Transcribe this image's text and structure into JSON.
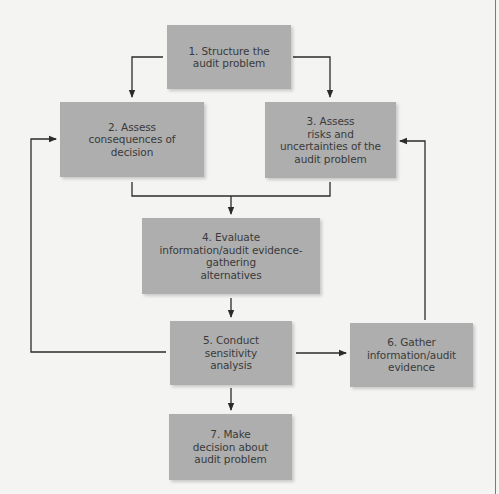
{
  "diagram": {
    "type": "flowchart",
    "colors": {
      "background": "#f4f4f3",
      "box_fill": "#aeaeae",
      "text": "#3a3a3a",
      "connector": "#2b2b2b"
    },
    "nodes": [
      {
        "id": 1,
        "label": "1. Structure the\naudit problem"
      },
      {
        "id": 2,
        "label": "2. Assess\nconsequences of\ndecision"
      },
      {
        "id": 3,
        "label": "3. Assess\nrisks and\nuncertainties of the\naudit problem"
      },
      {
        "id": 4,
        "label": "4. Evaluate\ninformation/audit evidence-\ngathering\nalternatives"
      },
      {
        "id": 5,
        "label": "5. Conduct\nsensitivity\nanalysis"
      },
      {
        "id": 6,
        "label": "6. Gather\ninformation/audit\nevidence"
      },
      {
        "id": 7,
        "label": "7. Make\ndecision about\naudit problem"
      }
    ],
    "edges": [
      {
        "from": 1,
        "to": 2
      },
      {
        "from": 1,
        "to": 3
      },
      {
        "from": 2,
        "to": 4
      },
      {
        "from": 3,
        "to": 4
      },
      {
        "from": 4,
        "to": 5
      },
      {
        "from": 5,
        "to": 6
      },
      {
        "from": 5,
        "to": 7
      },
      {
        "from": 5,
        "to": 2
      },
      {
        "from": 6,
        "to": 3
      }
    ]
  }
}
